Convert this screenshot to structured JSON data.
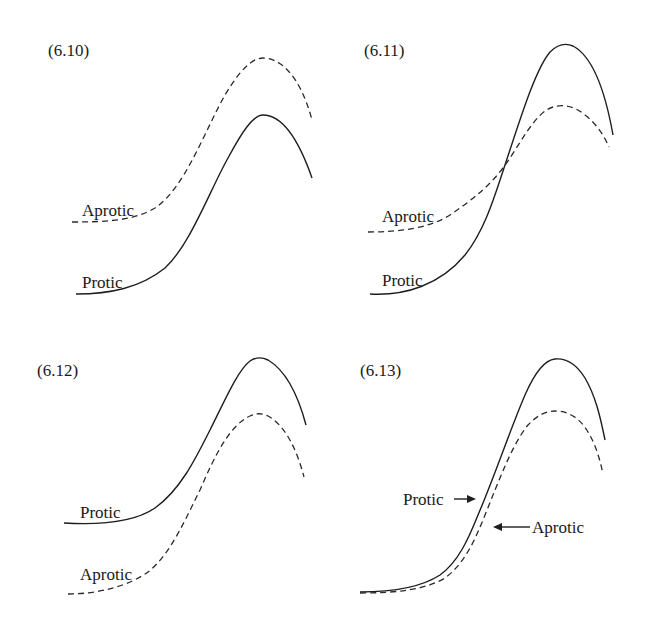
{
  "figure": {
    "panels": [
      {
        "id": "6.10",
        "label": "(6.10)",
        "curves": {
          "protic": {
            "label": "Protic",
            "style": "solid",
            "description": "lower curve throughout; lower start and lower peak"
          },
          "aprotic": {
            "label": "Aprotic",
            "style": "dashed",
            "description": "higher curve throughout; higher start and higher peak"
          }
        }
      },
      {
        "id": "6.11",
        "label": "(6.11)",
        "curves": {
          "protic": {
            "label": "Protic",
            "style": "solid",
            "description": "starts lower, crosses aprotic curve, ends with higher peak"
          },
          "aprotic": {
            "label": "Aprotic",
            "style": "dashed",
            "description": "starts higher, lower peak"
          }
        }
      },
      {
        "id": "6.12",
        "label": "(6.12)",
        "curves": {
          "protic": {
            "label": "Protic",
            "style": "solid",
            "description": "higher curve throughout"
          },
          "aprotic": {
            "label": "Aprotic",
            "style": "dashed",
            "description": "lower curve throughout"
          }
        }
      },
      {
        "id": "6.13",
        "label": "(6.13)",
        "curves": {
          "protic": {
            "label": "Protic",
            "style": "solid",
            "description": "same start as aprotic, higher peak",
            "annotation_arrow": "right"
          },
          "aprotic": {
            "label": "Aprotic",
            "style": "dashed",
            "description": "same start as protic, lower peak",
            "annotation_arrow": "left"
          }
        }
      }
    ]
  }
}
